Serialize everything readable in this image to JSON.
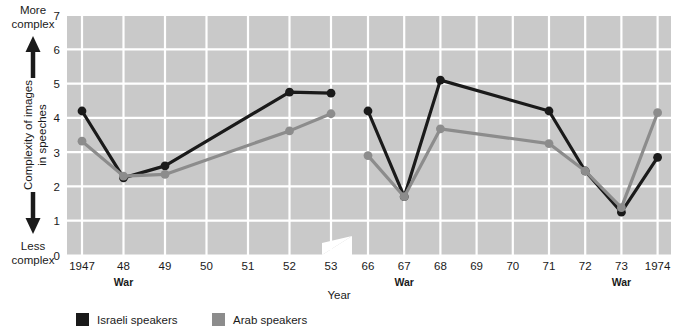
{
  "chart_data": {
    "type": "line",
    "title": "",
    "subtitle": "",
    "xlabel": "Year",
    "ylabel": "Complexity of images in speeches",
    "ylim": [
      0,
      7
    ],
    "yticks": [
      0,
      1,
      2,
      3,
      4,
      5,
      6,
      7
    ],
    "grid": true,
    "legend_position": "bottom-left",
    "axis_break": true,
    "axis_break_note": "break in x axis between 1953 and 1966",
    "y_axis_top_annotation": "More complex",
    "y_axis_bottom_annotation": "Less complex",
    "categories": [
      "1947",
      "48",
      "49",
      "50",
      "51",
      "52",
      "53",
      "66",
      "67",
      "68",
      "69",
      "70",
      "71",
      "72",
      "73",
      "1974"
    ],
    "series": [
      {
        "name": "Israeli speakers",
        "color": "#1a1a1a",
        "values": [
          4.2,
          2.25,
          2.6,
          null,
          null,
          4.75,
          4.72,
          4.2,
          1.7,
          5.1,
          null,
          null,
          4.2,
          2.45,
          1.25,
          2.85
        ]
      },
      {
        "name": "Arab speakers",
        "color": "#8c8c8c",
        "values": [
          3.32,
          2.3,
          2.35,
          null,
          null,
          3.62,
          4.12,
          2.9,
          1.7,
          3.68,
          null,
          null,
          3.25,
          2.45,
          1.38,
          4.15
        ]
      }
    ],
    "annotations": [
      {
        "label": "War",
        "x": "48"
      },
      {
        "label": "War",
        "x": "67"
      },
      {
        "label": "War",
        "x": "73"
      }
    ]
  },
  "colors": {
    "plot_background": "#c9c9c9",
    "grid": "#ffffff",
    "page_background": "#ffffff",
    "israeli": "#1a1a1a",
    "arab": "#8c8c8c",
    "text": "#1a1a1a"
  },
  "axis": {
    "y_tick_0": "0",
    "y_tick_1": "1",
    "y_tick_2": "2",
    "y_tick_3": "3",
    "y_tick_4": "4",
    "y_tick_5": "5",
    "y_tick_6": "6",
    "y_tick_7": "7",
    "y_label_line1": "Complexity of images",
    "y_label_line2": "in speeches",
    "top_anno_line1": "More",
    "top_anno_line2": "complex",
    "bottom_anno_line1": "Less",
    "bottom_anno_line2": "complex",
    "x_title": "Year"
  },
  "xticks": {
    "t1947": "1947",
    "t48": "48",
    "t49": "49",
    "t50": "50",
    "t51": "51",
    "t52": "52",
    "t53": "53",
    "t66": "66",
    "t67": "67",
    "t68": "68",
    "t69": "69",
    "t70": "70",
    "t71": "71",
    "t72": "72",
    "t73": "73",
    "t1974": "1974"
  },
  "war_marks": {
    "war48": "War",
    "war67": "War",
    "war73": "War"
  },
  "legend": {
    "israeli_label": "Israeli speakers",
    "arab_label": "Arab speakers"
  }
}
